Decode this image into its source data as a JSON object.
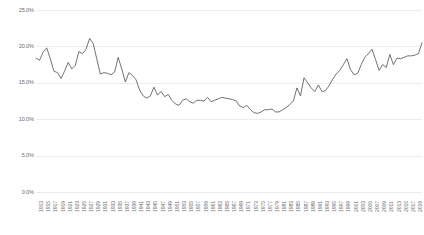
{
  "chart_data": {
    "type": "line",
    "title": "",
    "subtitle": "",
    "xlabel": "",
    "ylabel": "",
    "grid": true,
    "legend": false,
    "legend_position": "none",
    "ylim": [
      0,
      25
    ],
    "xlim": [
      1913,
      2021
    ],
    "ytick_labels": [
      "25.0%",
      "20.0%",
      "15.0%",
      "10.0%",
      "5.0%",
      "0.0%"
    ],
    "ytick_values": [
      25,
      20,
      15,
      10,
      5,
      0
    ],
    "xtick_labels": [
      "1913",
      "1915",
      "1917",
      "1919",
      "1921",
      "1923",
      "1925",
      "1927",
      "1929",
      "1931",
      "1933",
      "1935",
      "1937",
      "1939",
      "1941",
      "1943",
      "1945",
      "1947",
      "1949",
      "1951",
      "1953",
      "1955",
      "1957",
      "1959",
      "1961",
      "1963",
      "1965",
      "1967",
      "1969",
      "1971",
      "1973",
      "1975",
      "1977",
      "1979",
      "1981",
      "1983",
      "1985",
      "1987",
      "1989",
      "1991",
      "1993",
      "1995",
      "1997",
      "1999",
      "2001",
      "2003",
      "2005",
      "2007",
      "2009",
      "2011",
      "2013",
      "2015",
      "2017",
      "2019",
      "2021"
    ],
    "series": [
      {
        "name": "Top 1% income share",
        "color": "#595959",
        "x": [
          1913,
          1914,
          1915,
          1916,
          1917,
          1918,
          1919,
          1920,
          1921,
          1922,
          1923,
          1924,
          1925,
          1926,
          1927,
          1928,
          1929,
          1930,
          1931,
          1932,
          1933,
          1934,
          1935,
          1936,
          1937,
          1938,
          1939,
          1940,
          1941,
          1942,
          1943,
          1944,
          1945,
          1946,
          1947,
          1948,
          1949,
          1950,
          1951,
          1952,
          1953,
          1954,
          1955,
          1956,
          1957,
          1958,
          1959,
          1960,
          1961,
          1962,
          1963,
          1964,
          1965,
          1966,
          1967,
          1968,
          1969,
          1970,
          1971,
          1972,
          1973,
          1974,
          1975,
          1976,
          1977,
          1978,
          1979,
          1980,
          1981,
          1982,
          1983,
          1984,
          1985,
          1986,
          1987,
          1988,
          1989,
          1990,
          1991,
          1992,
          1993,
          1994,
          1995,
          1996,
          1997,
          1998,
          1999,
          2000,
          2001,
          2002,
          2003,
          2004,
          2005,
          2006,
          2007,
          2008,
          2009,
          2010,
          2011,
          2012,
          2013,
          2014,
          2015,
          2016,
          2017,
          2018,
          2019,
          2020,
          2021
        ],
        "values": [
          18.4,
          18.1,
          19.2,
          19.8,
          18.3,
          16.6,
          16.4,
          15.6,
          16.6,
          17.8,
          16.9,
          17.4,
          19.3,
          19.0,
          19.6,
          21.1,
          20.4,
          18.3,
          16.2,
          16.4,
          16.3,
          16.1,
          16.5,
          18.5,
          16.9,
          15.1,
          16.4,
          16.0,
          15.4,
          14.0,
          13.2,
          12.9,
          13.2,
          14.4,
          13.3,
          13.8,
          13.1,
          13.4,
          12.6,
          12.1,
          11.9,
          12.6,
          12.8,
          12.4,
          12.2,
          12.6,
          12.6,
          12.5,
          13.0,
          12.4,
          12.6,
          12.8,
          13.0,
          12.9,
          12.8,
          12.7,
          12.5,
          11.8,
          11.6,
          11.9,
          11.3,
          10.9,
          10.8,
          11.0,
          11.3,
          11.3,
          11.4,
          11.0,
          11.0,
          11.3,
          11.6,
          12.0,
          12.5,
          14.3,
          13.2,
          15.7,
          15.0,
          14.3,
          13.8,
          14.7,
          13.8,
          13.9,
          14.6,
          15.5,
          16.2,
          16.7,
          17.5,
          18.3,
          16.8,
          16.1,
          16.3,
          17.5,
          18.5,
          19.0,
          19.6,
          18.2,
          16.7,
          17.5,
          17.1,
          18.9,
          17.5,
          18.4,
          18.3,
          18.5,
          18.7,
          18.7,
          18.8,
          19.0,
          20.5
        ]
      }
    ]
  }
}
